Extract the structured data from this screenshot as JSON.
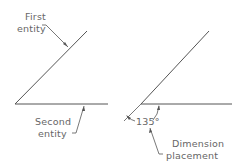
{
  "left_diagram": {
    "first_label_line1": "First",
    "first_label_line2": "entity",
    "second_label_line1": "Second",
    "second_label_line2": "entity"
  },
  "right_diagram": {
    "angle_value": "135°",
    "placement_label_line1": "Dimension",
    "placement_label_line2": "placement"
  },
  "colors": {
    "line": "#555555",
    "text": "#666666",
    "background": "#ffffff"
  }
}
